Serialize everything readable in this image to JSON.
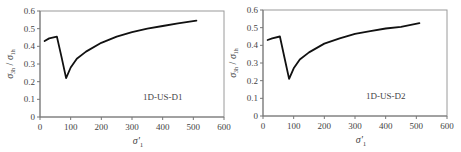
{
  "chart_data": [
    {
      "type": "line",
      "panel_label": "1D-US-D1",
      "xlabel": "σ'₁",
      "ylabel": "σ₃ₕ / σ₁ₕ",
      "xlim": [
        0,
        600
      ],
      "ylim": [
        0,
        0.6
      ],
      "xticks": [
        0,
        100,
        200,
        300,
        400,
        500,
        600
      ],
      "yticks": [
        0,
        0.1,
        0.2,
        0.3,
        0.4,
        0.5,
        0.6
      ],
      "grid": false,
      "series": [
        {
          "name": "1D-US-D1",
          "x": [
            15,
            30,
            55,
            70,
            85,
            100,
            120,
            150,
            200,
            250,
            300,
            350,
            400,
            450,
            510
          ],
          "y": [
            0.43,
            0.445,
            0.455,
            0.34,
            0.22,
            0.28,
            0.33,
            0.37,
            0.42,
            0.455,
            0.48,
            0.5,
            0.515,
            0.53,
            0.545
          ]
        }
      ]
    },
    {
      "type": "line",
      "panel_label": "1D-US-D2",
      "xlabel": "σ'₁",
      "ylabel": "σ₃ₕ / σ₁ₕ",
      "xlim": [
        0,
        600
      ],
      "ylim": [
        0,
        0.6
      ],
      "xticks": [
        0,
        100,
        200,
        300,
        400,
        500,
        600
      ],
      "yticks": [
        0,
        0.1,
        0.2,
        0.3,
        0.4,
        0.5,
        0.6
      ],
      "grid": false,
      "series": [
        {
          "name": "1D-US-D2",
          "x": [
            15,
            30,
            55,
            70,
            85,
            100,
            120,
            150,
            200,
            250,
            300,
            350,
            400,
            450,
            510
          ],
          "y": [
            0.43,
            0.44,
            0.45,
            0.33,
            0.21,
            0.27,
            0.32,
            0.36,
            0.41,
            0.44,
            0.465,
            0.48,
            0.495,
            0.505,
            0.525
          ]
        }
      ]
    }
  ],
  "panels": [
    {
      "label": "1D-US-D1",
      "xlabel": "σ'",
      "xlabel_sub": "1",
      "ylabel_num": "σ",
      "ylabel_num_sub": "3h",
      "ylabel_den": "σ",
      "ylabel_den_sub": "1h"
    },
    {
      "label": "1D-US-D2",
      "xlabel": "σ'",
      "xlabel_sub": "1",
      "ylabel_num": "σ",
      "ylabel_num_sub": "3h",
      "ylabel_den": "σ",
      "ylabel_den_sub": "1h"
    }
  ],
  "tick_labels": {
    "x": [
      "0",
      "100",
      "200",
      "300",
      "400",
      "500",
      "600"
    ],
    "y": [
      "0",
      "0.1",
      "0.2",
      "0.3",
      "0.4",
      "0.5",
      "0.6"
    ]
  }
}
